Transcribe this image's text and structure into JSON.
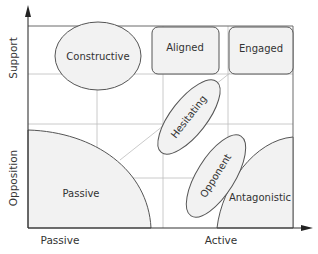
{
  "diagram": {
    "type": "stakeholder-attitude-matrix",
    "x_axis": {
      "low_label": "Passive",
      "high_label": "Active"
    },
    "y_axis": {
      "high_label": "Support",
      "low_label": "Opposition"
    },
    "regions": [
      {
        "id": "constructive",
        "label": "Constructive",
        "shape": "ellipse",
        "quadrant": "top-left"
      },
      {
        "id": "aligned",
        "label": "Aligned",
        "shape": "rounded-rect",
        "quadrant": "top-middle"
      },
      {
        "id": "engaged",
        "label": "Engaged",
        "shape": "rounded-rect",
        "quadrant": "top-right"
      },
      {
        "id": "hesitating",
        "label": "Hesitating",
        "shape": "tilted-ellipse",
        "quadrant": "center"
      },
      {
        "id": "opponent",
        "label": "Opponent",
        "shape": "tilted-ellipse",
        "quadrant": "lower-center"
      },
      {
        "id": "passive",
        "label": "Passive",
        "shape": "quarter-arc",
        "quadrant": "bottom-left"
      },
      {
        "id": "antagonistic",
        "label": "Antagonistic",
        "shape": "quarter-arc",
        "quadrant": "bottom-right"
      }
    ]
  }
}
